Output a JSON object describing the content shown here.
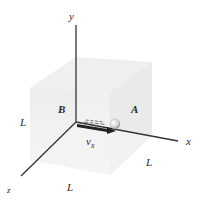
{
  "diagram": {
    "type": "3d-box-with-particle",
    "axes": {
      "x_label": "x",
      "y_label": "y",
      "z_label": "z"
    },
    "walls": {
      "left_label": "B",
      "right_label": "A"
    },
    "edge_labels": {
      "left": "L",
      "right": "L",
      "bottom": "L"
    },
    "velocity": {
      "symbol": "v",
      "subscript": "x"
    },
    "colors": {
      "box_fill": "#ececec",
      "box_side": "#f3f3f3",
      "axis": "#333333",
      "ball": "#dcdcdc",
      "arrow": "#222222"
    }
  }
}
